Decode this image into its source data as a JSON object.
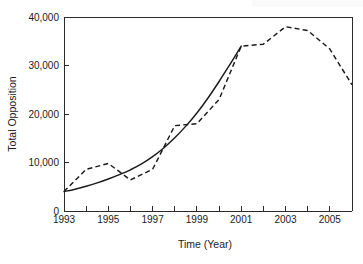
{
  "chart_data": {
    "type": "line",
    "title": "",
    "xlabel": "Time (Year)",
    "ylabel": "Total Opposition",
    "xlim": [
      1993,
      2006
    ],
    "ylim": [
      0,
      40000
    ],
    "grid": false,
    "legend": "none",
    "x_ticks": [
      1993,
      1994,
      1995,
      1996,
      1997,
      1998,
      1999,
      2000,
      2001,
      2002,
      2003,
      2004,
      2005,
      2006
    ],
    "x_tick_labels": [
      "1993",
      "",
      "1995",
      "",
      "1997",
      "",
      "1999",
      "",
      "2001",
      "",
      "2003",
      "",
      "2005",
      ""
    ],
    "y_ticks": [
      0,
      10000,
      20000,
      30000,
      40000
    ],
    "y_tick_labels": [
      "0",
      "10,000",
      "20,000",
      "30,000",
      "40,000"
    ],
    "series": [
      {
        "name": "fitted-trend",
        "style": "solid",
        "color": "#1a1a1a",
        "x": [
          1993,
          1993.5,
          1994,
          1994.5,
          1995,
          1995.5,
          1996,
          1996.5,
          1997,
          1997.5,
          1998,
          1998.5,
          1999,
          1999.5,
          2000,
          2000.5,
          2001
        ],
        "values": [
          4000,
          4500,
          5100,
          5800,
          6600,
          7500,
          8500,
          9700,
          11200,
          13000,
          15100,
          17500,
          20200,
          23300,
          26700,
          30300,
          34000
        ]
      },
      {
        "name": "observed-total-opposition",
        "style": "dashed",
        "color": "#1a1a1a",
        "x": [
          1993,
          1994,
          1995,
          1996,
          1997,
          1998,
          1999,
          2000,
          2001,
          2002,
          2003,
          2004,
          2005,
          2006
        ],
        "values": [
          4000,
          8600,
          9800,
          6400,
          8600,
          17600,
          18000,
          23000,
          34000,
          34400,
          38000,
          37200,
          33400,
          26000
        ]
      }
    ],
    "annotations": []
  },
  "axes": {
    "y_title": "Total Opposition",
    "x_title": "Time (Year)"
  }
}
